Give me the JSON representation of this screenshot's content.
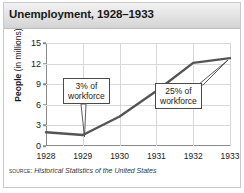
{
  "title": "Unemployment, 1928–1933",
  "source": {
    "label": "SOURCE:",
    "text": "Historical Statistics of the United States"
  },
  "colors": {
    "line": "#555555",
    "grid": "#d8d8d8",
    "axis": "#8a8a8a",
    "callout_border": "#4a4a4a",
    "title_bar": "#e2e2e2",
    "frame": "#c9c9c9"
  },
  "annotations": [
    {
      "id": "left",
      "line1": "3% of",
      "line2": "workforce",
      "target_year": "1929"
    },
    {
      "id": "right",
      "line1": "25% of",
      "line2": "workforce",
      "target_year": "1933"
    }
  ],
  "chart_data": {
    "type": "line",
    "title": "Unemployment, 1928–1933",
    "xlabel": "",
    "ylabel": "People (in millions)",
    "ylabel_bold": "People",
    "ylabel_rest": "(in millions)",
    "categories": [
      "1928",
      "1929",
      "1930",
      "1931",
      "1932",
      "1933"
    ],
    "values": [
      2.0,
      1.6,
      4.3,
      8.0,
      12.1,
      12.8
    ],
    "ylim": [
      0,
      15
    ],
    "yticks": [
      0,
      3,
      6,
      9,
      12,
      15
    ],
    "grid": true,
    "legend": "none",
    "annotations": [
      {
        "text": "3% of workforce",
        "at_year": "1929",
        "value": 1.6
      },
      {
        "text": "25% of workforce",
        "at_year": "1933",
        "value": 12.8
      }
    ]
  }
}
